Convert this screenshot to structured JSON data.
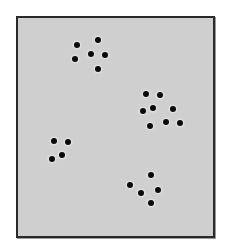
{
  "figure": {
    "panel": {
      "background": "#cfcfcf",
      "border": "#2a2a2a"
    },
    "dot_color": "#0a0a0a",
    "clusters": [
      {
        "name": "cluster-top-left",
        "count": 6,
        "dots": [
          [
            77,
            45
          ],
          [
            98,
            40
          ],
          [
            91,
            54
          ],
          [
            105,
            55
          ],
          [
            75,
            59
          ],
          [
            98,
            69
          ]
        ]
      },
      {
        "name": "cluster-mid-right",
        "count": 8,
        "dots": [
          [
            146,
            94
          ],
          [
            160,
            95
          ],
          [
            143,
            111
          ],
          [
            153,
            108
          ],
          [
            173,
            109
          ],
          [
            150,
            126
          ],
          [
            166,
            122
          ],
          [
            180,
            123
          ]
        ]
      },
      {
        "name": "cluster-mid-left",
        "count": 4,
        "dots": [
          [
            54,
            141
          ],
          [
            68,
            142
          ],
          [
            52,
            159
          ],
          [
            62,
            155
          ]
        ]
      },
      {
        "name": "cluster-bottom-right",
        "count": 5,
        "dots": [
          [
            151,
            175
          ],
          [
            130,
            185
          ],
          [
            158,
            190
          ],
          [
            141,
            193
          ],
          [
            151,
            203
          ]
        ]
      }
    ]
  }
}
